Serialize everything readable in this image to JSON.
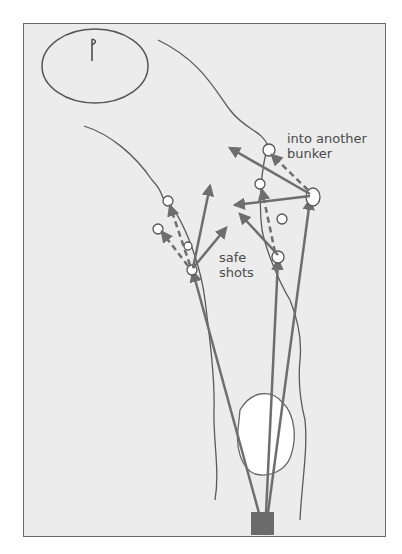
{
  "diagram": {
    "type": "golf-hole-strategy",
    "elements": {
      "green": {
        "label": "green with flag",
        "icon": "flag-icon"
      },
      "tee": {
        "label": "tee box"
      },
      "fairway_bunker": {
        "label": "fairway bunker"
      }
    },
    "annotations": {
      "safe": {
        "line1": "safe",
        "line2": "shots"
      },
      "risky": {
        "line1": "into another",
        "line2": "bunker"
      }
    },
    "colors": {
      "background": "#ececec",
      "line": "#5a5a5a",
      "arrow": "#6e6e6e",
      "tee": "#6b6b6b",
      "bunker": "#ffffff",
      "text": "#4a4a4a"
    }
  }
}
